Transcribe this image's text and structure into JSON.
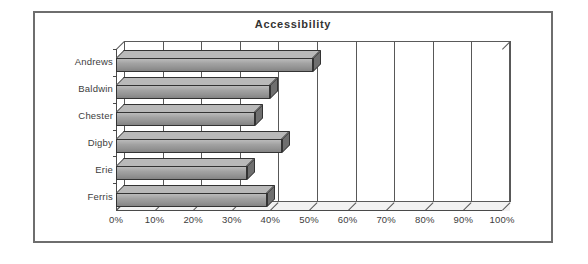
{
  "chart_data": {
    "type": "bar",
    "orientation": "horizontal",
    "title": "Accessibility",
    "xlabel": "",
    "ylabel": "",
    "categories": [
      "Andrews",
      "Baldwin",
      "Chester",
      "Digby",
      "Erie",
      "Ferris"
    ],
    "values": [
      51,
      40,
      36,
      43,
      34,
      39
    ],
    "value_unit": "%",
    "xlim": [
      0,
      100
    ],
    "xticks": [
      0,
      10,
      20,
      30,
      40,
      50,
      60,
      70,
      80,
      90,
      100
    ],
    "xtick_labels": [
      "0%",
      "10%",
      "20%",
      "30%",
      "40%",
      "50%",
      "60%",
      "70%",
      "80%",
      "90%",
      "100%"
    ],
    "grid": true,
    "grid_axis": "x",
    "legend": false,
    "legend_position": "none",
    "style": "3d-bar-grayscale",
    "series": [
      {
        "name": "Accessibility",
        "values": [
          51,
          40,
          36,
          43,
          34,
          39
        ]
      }
    ],
    "colors": {
      "bar_front": "#9d9d9d",
      "bar_top": "#b9b9b9",
      "bar_side": "#6f6f6f",
      "bar_outline": "#333333",
      "frame": "#6e6e6e",
      "axis": "#4a4a4a",
      "gridline": "#585858",
      "plot_background": "#ffffff",
      "floor": "#f2f2f2",
      "text": "#3d3d3d"
    }
  }
}
